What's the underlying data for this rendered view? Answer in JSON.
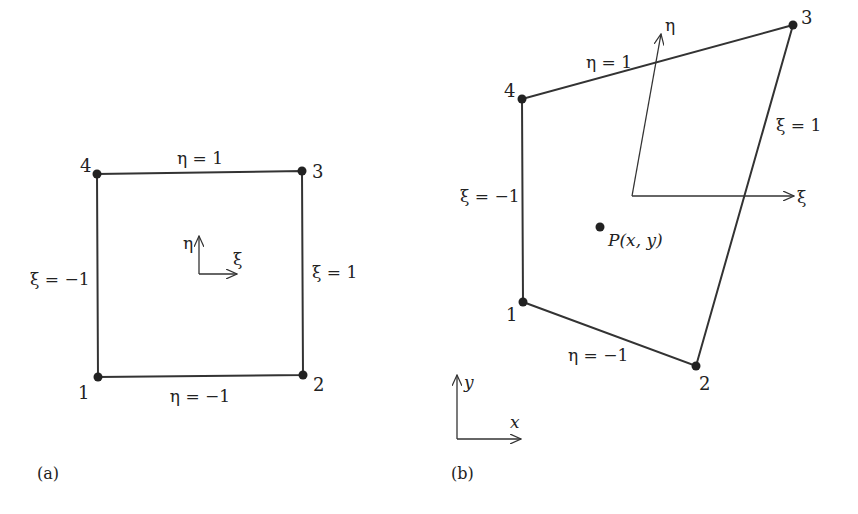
{
  "panel_a": {
    "caption": "(a)",
    "nodes": [
      {
        "id": "1",
        "x": 98,
        "y": 377,
        "label_x": 80,
        "label_y": 398
      },
      {
        "id": "2",
        "x": 303,
        "y": 375,
        "label_x": 313,
        "label_y": 390
      },
      {
        "id": "3",
        "x": 302,
        "y": 171,
        "label_x": 313,
        "label_y": 179
      },
      {
        "id": "4",
        "x": 97,
        "y": 174,
        "label_x": 80,
        "label_y": 170
      }
    ],
    "edge_labels": {
      "top": "η = 1",
      "bottom": "η = −1",
      "left": "ξ = −1",
      "right": "ξ = 1"
    },
    "local_axes": {
      "eta": "η",
      "xi": "ξ"
    }
  },
  "panel_b": {
    "caption": "(b)",
    "nodes": [
      {
        "id": "1",
        "x": 523,
        "y": 302,
        "label_x": 508,
        "label_y": 320
      },
      {
        "id": "2",
        "x": 696,
        "y": 366,
        "label_x": 700,
        "label_y": 389
      },
      {
        "id": "3",
        "x": 793,
        "y": 25,
        "label_x": 802,
        "label_y": 24
      },
      {
        "id": "4",
        "x": 522,
        "y": 99,
        "label_x": 505,
        "label_y": 96
      }
    ],
    "edge_labels": {
      "top": "η = 1",
      "bottom": "η = −1",
      "left": "ξ = −1",
      "right": "ξ = 1"
    },
    "local_axes": {
      "eta": "η",
      "xi": "ξ"
    },
    "point": {
      "label": "P(x, y)"
    },
    "global_axes": {
      "x": "x",
      "y": "y"
    }
  }
}
